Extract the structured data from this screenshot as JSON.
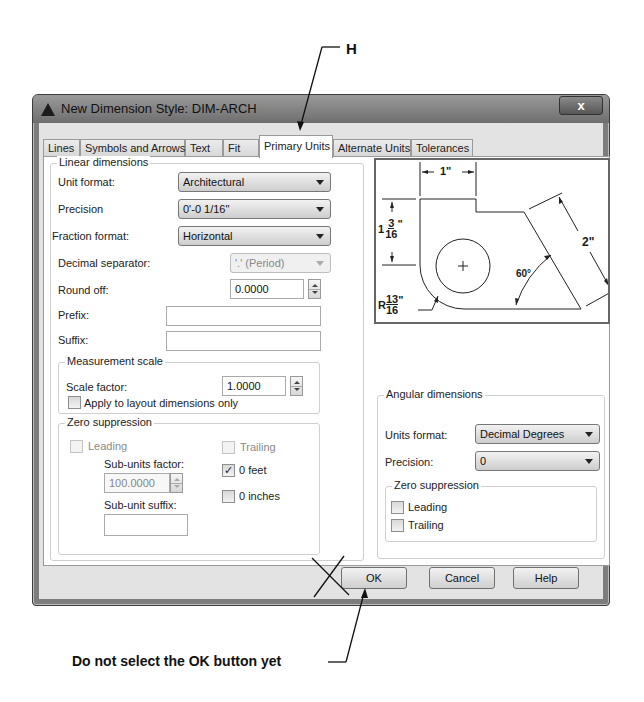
{
  "annotations": {
    "top_label": "H",
    "bottom_note": "Do not select the OK button yet"
  },
  "window": {
    "title": "New Dimension Style: DIM-ARCH",
    "close_glyph": "x"
  },
  "tabs": [
    {
      "label": "Lines"
    },
    {
      "label": "Symbols and Arrows"
    },
    {
      "label": "Text"
    },
    {
      "label": "Fit"
    },
    {
      "label": "Primary Units",
      "active": true
    },
    {
      "label": "Alternate Units"
    },
    {
      "label": "Tolerances"
    }
  ],
  "linear": {
    "legend": "Linear dimensions",
    "unit_format": {
      "label": "Unit format:",
      "value": "Architectural"
    },
    "precision": {
      "label": "Precision",
      "value": "0'-0 1/16\""
    },
    "fraction_format": {
      "label": "Fraction format:",
      "value": "Horizontal"
    },
    "decimal_separator": {
      "label": "Decimal separator:",
      "value": "'.' (Period)"
    },
    "round_off": {
      "label": "Round off:",
      "value": "0.0000"
    },
    "prefix": {
      "label": "Prefix:",
      "value": ""
    },
    "suffix": {
      "label": "Suffix:",
      "value": ""
    }
  },
  "measurement_scale": {
    "legend": "Measurement scale",
    "scale_factor": {
      "label": "Scale factor:",
      "value": "1.0000"
    },
    "apply_layout": {
      "label": "Apply to layout dimensions only",
      "checked": false
    }
  },
  "zero_suppression_linear": {
    "legend": "Zero suppression",
    "leading": {
      "label": "Leading",
      "checked": false,
      "disabled": true
    },
    "trailing": {
      "label": "Trailing",
      "checked": false,
      "disabled": true
    },
    "sub_units_factor": {
      "label": "Sub-units factor:",
      "value": "100.0000"
    },
    "sub_unit_suffix": {
      "label": "Sub-unit suffix:",
      "value": ""
    },
    "zero_feet": {
      "label": "0 feet",
      "checked": true,
      "check_glyph": "✓"
    },
    "zero_inches": {
      "label": "0 inches",
      "checked": false
    }
  },
  "preview": {
    "dim_top": "1\"",
    "dim_left_whole": "1",
    "dim_left_num": "3",
    "dim_left_den": "16",
    "dim_left_unit": "\"",
    "dim_right": "2\"",
    "dim_angle": "60°",
    "dim_radius_prefix": "R",
    "dim_radius_num": "13",
    "dim_radius_den": "16",
    "dim_radius_unit": "\""
  },
  "angular": {
    "legend": "Angular dimensions",
    "units_format": {
      "label": "Units format:",
      "value": "Decimal Degrees"
    },
    "precision": {
      "label": "Precision:",
      "value": "0"
    },
    "zero_suppression": {
      "legend": "Zero suppression",
      "leading": {
        "label": "Leading",
        "checked": false
      },
      "trailing": {
        "label": "Trailing",
        "checked": false
      }
    }
  },
  "buttons": {
    "ok": "OK",
    "cancel": "Cancel",
    "help": "Help"
  }
}
